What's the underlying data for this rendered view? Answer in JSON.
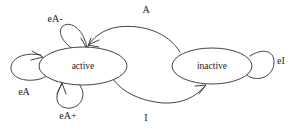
{
  "diagram": {
    "type": "state-machine",
    "title": "",
    "background_color": "#ffffff",
    "stroke_color": "#2e2e2e",
    "nodes": [
      {
        "id": "active",
        "label": "active",
        "shape": "ellipse",
        "cx": 83,
        "cy": 66,
        "rx": 44,
        "ry": 19
      },
      {
        "id": "inactive",
        "label": "inactive",
        "shape": "ellipse",
        "cx": 212,
        "cy": 66,
        "rx": 40,
        "ry": 18
      }
    ],
    "transitions": [
      {
        "id": "a-transition",
        "label": "A",
        "from": "inactive",
        "to": "active",
        "label_x": 146,
        "label_y": 11
      },
      {
        "id": "i-transition",
        "label": "I",
        "from": "active",
        "to": "inactive",
        "label_x": 146,
        "label_y": 119
      },
      {
        "id": "ea-minus-loop",
        "label": "eA-",
        "from": "active",
        "to": "active",
        "label_x": 55,
        "label_y": 20
      },
      {
        "id": "ea-loop",
        "label": "eA",
        "from": "active",
        "to": "active",
        "label_x": 24,
        "label_y": 93
      },
      {
        "id": "ea-plus-loop",
        "label": "eA+",
        "from": "active",
        "to": "active",
        "label_x": 68,
        "label_y": 117
      },
      {
        "id": "ei-loop",
        "label": "eI",
        "from": "inactive",
        "to": "inactive",
        "label_x": 281,
        "label_y": 62
      }
    ]
  }
}
